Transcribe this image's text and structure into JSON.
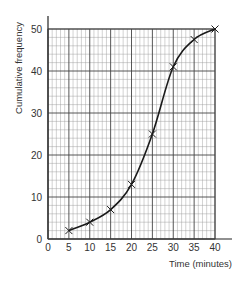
{
  "chart_data": {
    "type": "line",
    "title": "",
    "xlabel": "Time (minutes)",
    "ylabel": "Cumulative frequency",
    "x": [
      5,
      10,
      15,
      20,
      25,
      30,
      35,
      40
    ],
    "series": [
      {
        "name": "Cumulative frequency",
        "values": [
          2,
          4,
          7,
          13,
          25,
          41,
          47.5,
          50
        ],
        "marker": "x",
        "smooth": true
      }
    ],
    "xlim": [
      0,
      40
    ],
    "ylim": [
      0,
      50
    ],
    "xticks": [
      0,
      5,
      10,
      15,
      20,
      25,
      30,
      35,
      40
    ],
    "yticks": [
      0,
      10,
      20,
      30,
      40,
      50
    ],
    "grid": {
      "major": true,
      "minor": true,
      "minor_step_x": 1,
      "minor_step_y": 2
    },
    "legend": "none"
  },
  "colors": {
    "line": "#1a1a1a",
    "grid_major": "#444444",
    "grid_minor": "#9a9a9a",
    "text": "#333333"
  }
}
